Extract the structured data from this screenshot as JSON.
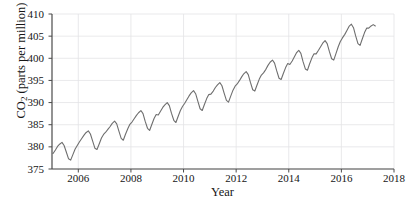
{
  "figure": {
    "top_crop_text": "",
    "background_color": "#ffffff"
  },
  "chart_data": {
    "type": "line",
    "title": "",
    "xlabel": "Year",
    "ylabel": "CO2 (parts per million)",
    "ylabel_parts": {
      "prefix": "CO",
      "subscript": "2",
      "suffix": " (parts per million)"
    },
    "xlim": [
      2005.0,
      2018.0
    ],
    "ylim": [
      375,
      410
    ],
    "xticks": [
      2006,
      2008,
      2010,
      2012,
      2014,
      2016,
      2018
    ],
    "xtick_labels": [
      "2006",
      "2008",
      "2010",
      "2012",
      "2014",
      "2016",
      "2018"
    ],
    "yticks": [
      375,
      380,
      385,
      390,
      395,
      400,
      405,
      410
    ],
    "ytick_labels": [
      "375",
      "380",
      "385",
      "390",
      "395",
      "400",
      "405",
      "410"
    ],
    "grid": true,
    "grid_color": "#e3e3e6",
    "axis_color": "#4a4a4a",
    "legend": null,
    "series": [
      {
        "name": "Monthly mean CO2",
        "color": "#6e6e6e",
        "line_width": 1.1,
        "x": [
          2005.04,
          2005.13,
          2005.21,
          2005.29,
          2005.38,
          2005.46,
          2005.54,
          2005.63,
          2005.71,
          2005.79,
          2005.88,
          2005.96,
          2006.04,
          2006.13,
          2006.21,
          2006.29,
          2006.38,
          2006.46,
          2006.54,
          2006.63,
          2006.71,
          2006.79,
          2006.88,
          2006.96,
          2007.04,
          2007.13,
          2007.21,
          2007.29,
          2007.38,
          2007.46,
          2007.54,
          2007.63,
          2007.71,
          2007.79,
          2007.88,
          2007.96,
          2008.04,
          2008.13,
          2008.21,
          2008.29,
          2008.38,
          2008.46,
          2008.54,
          2008.63,
          2008.71,
          2008.79,
          2008.88,
          2008.96,
          2009.04,
          2009.13,
          2009.21,
          2009.29,
          2009.38,
          2009.46,
          2009.54,
          2009.63,
          2009.71,
          2009.79,
          2009.88,
          2009.96,
          2010.04,
          2010.13,
          2010.21,
          2010.29,
          2010.38,
          2010.46,
          2010.54,
          2010.63,
          2010.71,
          2010.79,
          2010.88,
          2010.96,
          2011.04,
          2011.13,
          2011.21,
          2011.29,
          2011.38,
          2011.46,
          2011.54,
          2011.63,
          2011.71,
          2011.79,
          2011.88,
          2011.96,
          2012.04,
          2012.13,
          2012.21,
          2012.29,
          2012.38,
          2012.46,
          2012.54,
          2012.63,
          2012.71,
          2012.79,
          2012.88,
          2012.96,
          2013.04,
          2013.13,
          2013.21,
          2013.29,
          2013.38,
          2013.46,
          2013.54,
          2013.63,
          2013.71,
          2013.79,
          2013.88,
          2013.96,
          2014.04,
          2014.13,
          2014.21,
          2014.29,
          2014.38,
          2014.46,
          2014.54,
          2014.63,
          2014.71,
          2014.79,
          2014.88,
          2014.96,
          2015.04,
          2015.13,
          2015.21,
          2015.29,
          2015.38,
          2015.46,
          2015.54,
          2015.63,
          2015.71,
          2015.79,
          2015.88,
          2015.96,
          2016.04,
          2016.13,
          2016.21,
          2016.29,
          2016.38,
          2016.46,
          2016.54,
          2016.63,
          2016.71,
          2016.79,
          2016.88,
          2016.96,
          2017.04,
          2017.13,
          2017.21,
          2017.29
        ],
        "y": [
          378.5,
          379.3,
          380.1,
          380.6,
          381.0,
          380.3,
          378.9,
          377.3,
          377.0,
          378.2,
          379.5,
          380.3,
          381.1,
          381.9,
          382.6,
          383.2,
          383.6,
          382.9,
          381.4,
          379.7,
          379.4,
          380.6,
          382.0,
          382.8,
          383.3,
          384.0,
          384.6,
          385.3,
          385.8,
          385.2,
          383.6,
          381.9,
          381.5,
          382.8,
          384.1,
          385.1,
          385.6,
          386.4,
          387.1,
          387.7,
          388.2,
          387.5,
          385.8,
          384.2,
          383.7,
          385.0,
          386.4,
          387.3,
          387.2,
          388.1,
          388.9,
          389.5,
          390.0,
          389.3,
          387.6,
          386.0,
          385.5,
          386.8,
          388.2,
          389.1,
          389.8,
          390.7,
          391.5,
          392.2,
          392.7,
          392.0,
          390.4,
          388.6,
          388.2,
          389.5,
          390.9,
          391.8,
          391.9,
          392.6,
          393.4,
          394.0,
          394.5,
          393.8,
          392.2,
          390.5,
          390.1,
          391.4,
          392.8,
          393.7,
          394.2,
          395.0,
          395.8,
          396.5,
          397.0,
          396.3,
          394.6,
          392.9,
          392.6,
          393.9,
          395.3,
          396.2,
          396.7,
          397.5,
          398.4,
          399.1,
          399.6,
          398.9,
          397.2,
          395.5,
          395.2,
          396.5,
          397.9,
          398.8,
          398.6,
          399.4,
          400.3,
          401.2,
          401.8,
          401.1,
          399.3,
          397.6,
          397.3,
          398.7,
          400.1,
          401.0,
          401.0,
          401.8,
          402.6,
          403.4,
          404.0,
          403.3,
          401.6,
          399.9,
          399.6,
          401.0,
          402.6,
          403.8,
          404.6,
          405.4,
          406.3,
          407.2,
          407.7,
          406.9,
          405.1,
          403.3,
          402.9,
          404.3,
          405.8,
          406.8,
          406.8,
          407.3,
          407.6,
          407.3
        ]
      }
    ]
  }
}
